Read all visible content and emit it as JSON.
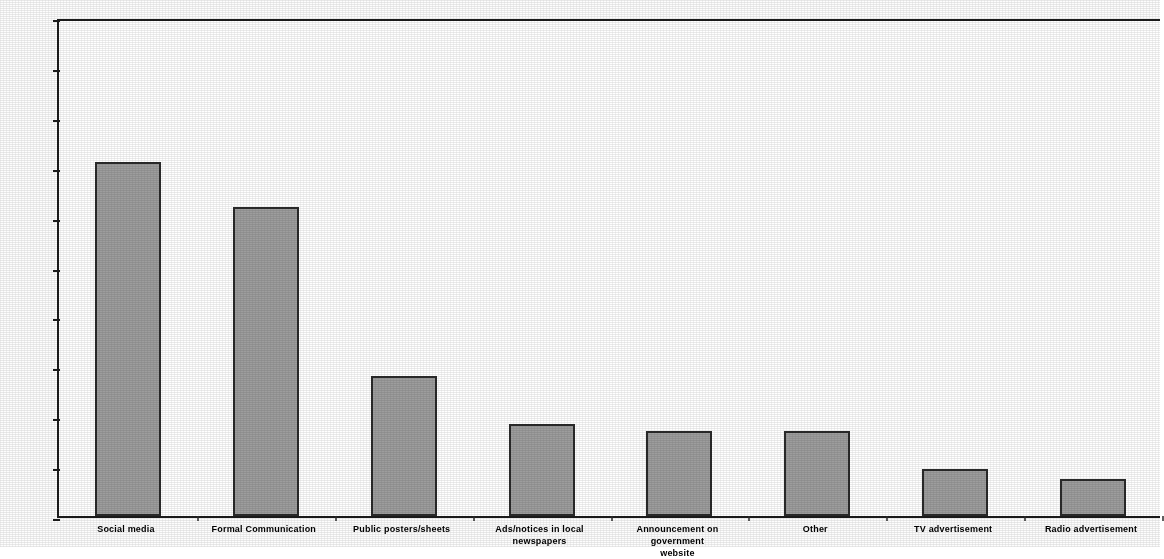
{
  "chart_data": {
    "type": "bar",
    "title": "",
    "subtitle": "",
    "xlabel": "",
    "ylabel": "",
    "ylim": [
      0,
      100
    ],
    "y_tick_step": 10,
    "grid": false,
    "legend": null,
    "legend_position": "none",
    "value_format": "percent",
    "bar_fill_color": "#9d9d9d",
    "bar_border_color": "#2a2a2a",
    "axis_color": "#1c1c1c",
    "background_color": "#ffffff",
    "categories": [
      "Social media",
      "Formal Communication",
      "Public posters/sheets",
      "Ads/notices in local newspapers",
      "Announcement on government website",
      "Other",
      "TV advertisement",
      "Radio advertisement"
    ],
    "category_lines": [
      [
        "Social media"
      ],
      [
        "Formal Communication"
      ],
      [
        "Public posters/sheets"
      ],
      [
        "Ads/notices in local",
        "newspapers"
      ],
      [
        "Announcement on government",
        "website"
      ],
      [
        "Other"
      ],
      [
        "TV advertisement"
      ],
      [
        "Radio advertisement"
      ]
    ],
    "values": [
      71,
      62,
      28,
      18.5,
      17,
      17,
      9.5,
      7.5
    ],
    "y_tick_labels": [
      "100%",
      "90%",
      "80%",
      "70%",
      "60%",
      "50%",
      "40%",
      "30%",
      "20%",
      "10%",
      "0%"
    ],
    "y_tick_values": [
      100,
      90,
      80,
      70,
      60,
      50,
      40,
      30,
      20,
      10,
      0
    ]
  }
}
